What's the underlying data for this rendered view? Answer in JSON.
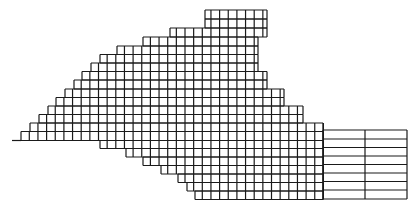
{
  "diagram": {
    "type": "finite-element-mesh",
    "line_color": "#1a1a1a",
    "background": "#ffffff",
    "pitch": 8.65,
    "origin_x": 12,
    "origin_y": 10,
    "rows": [
      {
        "y0": 10.0,
        "y1": 19.0,
        "x0": 205,
        "x1": 267
      },
      {
        "y0": 19.0,
        "y1": 28.0,
        "x0": 205,
        "x1": 267
      },
      {
        "y0": 28.0,
        "y1": 37.0,
        "x0": 170,
        "x1": 267
      },
      {
        "y0": 37.0,
        "y1": 46.0,
        "x0": 143,
        "x1": 258
      },
      {
        "y0": 46.0,
        "y1": 54.5,
        "x0": 117,
        "x1": 258
      },
      {
        "y0": 54.5,
        "y1": 63.0,
        "x0": 100,
        "x1": 258
      },
      {
        "y0": 63.0,
        "y1": 71.5,
        "x0": 91,
        "x1": 258
      },
      {
        "y0": 71.5,
        "y1": 80.0,
        "x0": 82,
        "x1": 267
      },
      {
        "y0": 80.0,
        "y1": 89.0,
        "x0": 74,
        "x1": 267
      },
      {
        "y0": 89.0,
        "y1": 97.5,
        "x0": 65,
        "x1": 284
      },
      {
        "y0": 97.5,
        "y1": 106.0,
        "x0": 56,
        "x1": 284
      },
      {
        "y0": 106.0,
        "y1": 114.5,
        "x0": 48,
        "x1": 303
      },
      {
        "y0": 114.5,
        "y1": 123.0,
        "x0": 39,
        "x1": 303
      },
      {
        "y0": 123.0,
        "y1": 131.5,
        "x0": 30,
        "x1": 323
      },
      {
        "y0": 131.5,
        "y1": 140.5,
        "x0": 21,
        "x1": 323
      },
      {
        "y0": 140.5,
        "y1": 148.5,
        "x0": 100,
        "x1": 323
      },
      {
        "y0": 148.5,
        "y1": 157.0,
        "x0": 126,
        "x1": 323
      },
      {
        "y0": 157.0,
        "y1": 165.5,
        "x0": 143,
        "x1": 323
      },
      {
        "y0": 165.5,
        "y1": 174.0,
        "x0": 161,
        "x1": 323
      },
      {
        "y0": 174.0,
        "y1": 182.5,
        "x0": 178,
        "x1": 323
      },
      {
        "y0": 182.5,
        "y1": 191.0,
        "x0": 187,
        "x1": 323
      },
      {
        "y0": 191.0,
        "y1": 199.5,
        "x0": 195,
        "x1": 323
      }
    ],
    "tail": {
      "x0": 12,
      "x1": 21,
      "y": 140.5
    },
    "coarse_region": {
      "x_lines": [
        323,
        365,
        407
      ],
      "y_lines": [
        130.0,
        139.0,
        147.5,
        156.0,
        164.5,
        173.0,
        181.5,
        190.0,
        199.0
      ]
    }
  }
}
